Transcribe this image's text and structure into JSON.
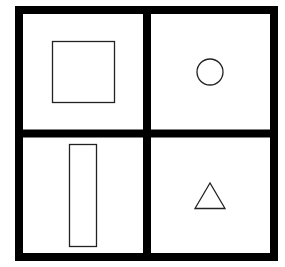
{
  "diagram": {
    "title": "",
    "grid": {
      "rows": 2,
      "cols": 2,
      "frame_color": "#000000",
      "background": "#ffffff"
    },
    "cells": [
      {
        "position": "top-left",
        "shape": "square"
      },
      {
        "position": "top-right",
        "shape": "circle"
      },
      {
        "position": "bottom-left",
        "shape": "tall-rectangle"
      },
      {
        "position": "bottom-right",
        "shape": "triangle"
      }
    ]
  }
}
